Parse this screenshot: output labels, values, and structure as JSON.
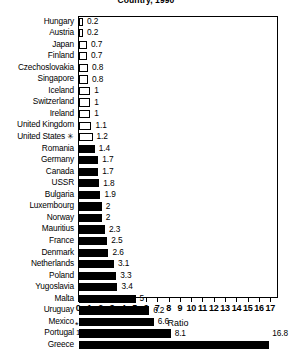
{
  "chart_data": {
    "type": "bar",
    "orientation": "horizontal",
    "title": "Country, 1990",
    "xlabel": "Ratio",
    "ylabel": "",
    "xlim": [
      0,
      17.5
    ],
    "xticks": [
      "0",
      "1",
      "2",
      "3",
      "4",
      "5",
      "6",
      "7",
      "8",
      "9",
      "10",
      "11",
      "12",
      "13",
      "14",
      "15",
      "16",
      "17"
    ],
    "grid": false,
    "legend": "none",
    "footnote_marker": "*",
    "footnote": "1989 data.",
    "categories": [
      "Hungary",
      "Austria",
      "Japan",
      "Finland",
      "Czechoslovakia",
      "Singapore",
      "Iceland",
      "Switzerland",
      "Ireland",
      "United Kingdom",
      "United States",
      "Romania",
      "Germany",
      "Canada",
      "USSR",
      "Bulgaria",
      "Luxembourg",
      "Norway",
      "Mauritius",
      "France",
      "Denmark",
      "Netherlands",
      "Poland",
      "Yugoslavia",
      "Malta",
      "Uruguay",
      "Mexico",
      "Portugal",
      "Greece"
    ],
    "values": [
      0.2,
      0.2,
      0.7,
      0.7,
      0.8,
      0.8,
      1,
      1,
      1,
      1.1,
      1.2,
      1.4,
      1.7,
      1.7,
      1.8,
      1.9,
      2,
      2,
      2.3,
      2.5,
      2.6,
      3.1,
      3.3,
      3.4,
      5,
      6.2,
      6.6,
      8.1,
      16.8
    ],
    "value_labels": [
      "0.2",
      "0.2",
      "0.7",
      "0.7",
      "0.8",
      "0.8",
      "1",
      "1",
      "1",
      "1.1",
      "1.2",
      "1.4",
      "1.7",
      "1.7",
      "1.8",
      "1.9",
      "2",
      "2",
      "2.3",
      "2.5",
      "2.6",
      "3.1",
      "3.3",
      "3.4",
      "5",
      "6.2",
      "6.6",
      "8.1",
      "16.8"
    ],
    "marked_categories": [
      "United States"
    ],
    "bar_styles": [
      "hollow",
      "hollow",
      "hollow",
      "hollow",
      "hollow",
      "hollow",
      "hollow",
      "hollow",
      "hollow",
      "hollow",
      "hollow",
      "filled",
      "filled",
      "filled",
      "filled",
      "filled",
      "filled",
      "filled",
      "filled",
      "filled",
      "filled",
      "filled",
      "filled",
      "filled",
      "filled",
      "filled",
      "filled",
      "filled",
      "filled"
    ],
    "colors": {
      "bar_filled": "#000000",
      "bar_hollow_fill": "#ffffff",
      "bar_border": "#000000",
      "text": "#000000",
      "background": "#ffffff"
    }
  }
}
